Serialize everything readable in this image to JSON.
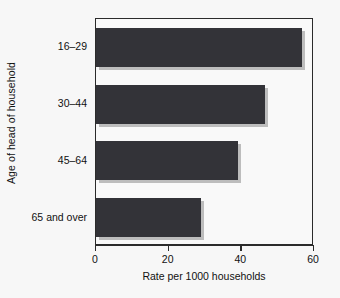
{
  "chart_data": {
    "type": "bar",
    "orientation": "horizontal",
    "title": "",
    "xlabel": "Rate per 1000 households",
    "ylabel": "Age of head of household",
    "categories": [
      "16–29",
      "30–44",
      "45–64",
      "65 and over"
    ],
    "values": [
      56.7,
      46.5,
      39.0,
      28.9
    ],
    "xlim": [
      0,
      60
    ],
    "xticks": [
      0,
      20,
      40,
      60
    ],
    "xtick_labels": [
      "0",
      "20",
      "40",
      "60"
    ],
    "grid": false,
    "legend": null,
    "series": [
      {
        "name": "Rate per 1000 households",
        "values": [
          56.7,
          46.5,
          39.0,
          28.9
        ]
      }
    ]
  },
  "style": {
    "bar_color": "#333338",
    "shadow_color": "#bdbdbd",
    "axis_color": "#2b2b2b",
    "background": "#f7f7f7",
    "plot_background": "#f9f9f9",
    "text_color": "#111111"
  }
}
